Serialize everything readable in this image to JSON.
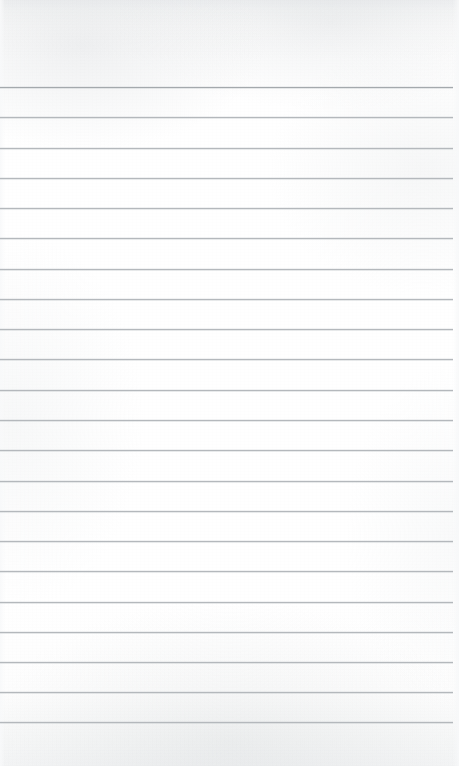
{
  "document": {
    "kind": "scanned-ruled-notebook-page",
    "title": "Blank lined notebook page",
    "page_width": 459,
    "page_height": 766,
    "orientation": "portrait",
    "has_visible_text": false,
    "has_handwriting": false,
    "has_margin_rule": false,
    "has_holes": false
  },
  "colors": {
    "paper": "#ffffff",
    "paper_top_tint": "#f1f2f3",
    "paper_bottom_tint": "#f3f4f5",
    "rule_line": "#b4b8bc",
    "rule_line_strong": "#a4a9ad"
  },
  "ruling": {
    "line_count": 22,
    "first_line_y": 87,
    "last_line_y": 722,
    "spacing_px": 30.24,
    "line_thickness_px": 1,
    "left_inset_px": 0,
    "right_inset_px": 6,
    "header_blank_height_px": 87,
    "footer_blank_height_px": 44,
    "lines": [
      {
        "index": 1,
        "y": 87,
        "emphasis": "strong",
        "text": ""
      },
      {
        "index": 2,
        "y": 117,
        "emphasis": "normal",
        "text": ""
      },
      {
        "index": 3,
        "y": 148,
        "emphasis": "normal",
        "text": ""
      },
      {
        "index": 4,
        "y": 178,
        "emphasis": "normal",
        "text": ""
      },
      {
        "index": 5,
        "y": 208,
        "emphasis": "normal",
        "text": ""
      },
      {
        "index": 6,
        "y": 238,
        "emphasis": "normal",
        "text": ""
      },
      {
        "index": 7,
        "y": 269,
        "emphasis": "normal",
        "text": ""
      },
      {
        "index": 8,
        "y": 299,
        "emphasis": "normal",
        "text": ""
      },
      {
        "index": 9,
        "y": 329,
        "emphasis": "normal",
        "text": ""
      },
      {
        "index": 10,
        "y": 359,
        "emphasis": "normal",
        "text": ""
      },
      {
        "index": 11,
        "y": 390,
        "emphasis": "normal",
        "text": ""
      },
      {
        "index": 12,
        "y": 420,
        "emphasis": "normal",
        "text": ""
      },
      {
        "index": 13,
        "y": 450,
        "emphasis": "normal",
        "text": ""
      },
      {
        "index": 14,
        "y": 481,
        "emphasis": "normal",
        "text": ""
      },
      {
        "index": 15,
        "y": 511,
        "emphasis": "normal",
        "text": ""
      },
      {
        "index": 16,
        "y": 541,
        "emphasis": "normal",
        "text": ""
      },
      {
        "index": 17,
        "y": 571,
        "emphasis": "normal",
        "text": ""
      },
      {
        "index": 18,
        "y": 602,
        "emphasis": "normal",
        "text": ""
      },
      {
        "index": 19,
        "y": 632,
        "emphasis": "normal",
        "text": ""
      },
      {
        "index": 20,
        "y": 662,
        "emphasis": "normal",
        "text": ""
      },
      {
        "index": 21,
        "y": 692,
        "emphasis": "normal",
        "text": ""
      },
      {
        "index": 22,
        "y": 722,
        "emphasis": "normal",
        "text": ""
      }
    ]
  },
  "header": {
    "text": ""
  },
  "footer": {
    "text": ""
  }
}
